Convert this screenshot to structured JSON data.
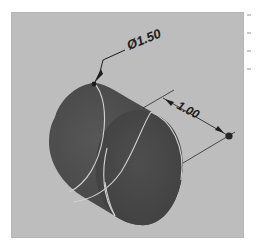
{
  "viewport": {
    "background": "#bdbdbd",
    "body_color": "#4a4a4a",
    "edge_color": "#cfcfcf"
  },
  "dimensions": {
    "diameter": {
      "symbol": "Ø",
      "value": "1.50",
      "label": "Ø1.50"
    },
    "length": {
      "value": "1.00",
      "label": "1.00"
    }
  },
  "model": {
    "shape": "cylinder",
    "view": "isometric"
  }
}
